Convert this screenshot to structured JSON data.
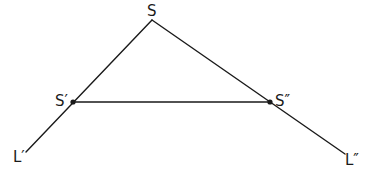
{
  "diagram": {
    "colors": {
      "stroke": "#1a1a1a",
      "background": "#ffffff"
    },
    "points": {
      "S": {
        "label": "S",
        "x": 152,
        "y": 20
      },
      "S1": {
        "label": "S′",
        "x": 73,
        "y": 102
      },
      "S2": {
        "label": "S″",
        "x": 270,
        "y": 102
      },
      "L1": {
        "label": "L′",
        "x": 26,
        "y": 152
      },
      "L2": {
        "label": "L″",
        "x": 345,
        "y": 154
      }
    },
    "segments": [
      {
        "from": "S",
        "to": "L1"
      },
      {
        "from": "S",
        "to": "L2"
      },
      {
        "from": "S1",
        "to": "S2"
      }
    ]
  }
}
